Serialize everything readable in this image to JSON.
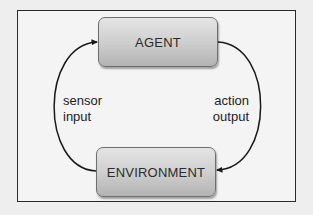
{
  "diagram": {
    "type": "feedback-loop",
    "nodes": {
      "agent": {
        "label": "AGENT"
      },
      "environment": {
        "label": "ENVIRONMENT"
      }
    },
    "edges": [
      {
        "from": "environment",
        "to": "agent",
        "side": "left",
        "label_lines": [
          "sensor",
          "input"
        ]
      },
      {
        "from": "agent",
        "to": "environment",
        "side": "right",
        "label_lines": [
          "action",
          "output"
        ]
      }
    ],
    "colors": {
      "background": "#eeeeee",
      "frame_border": "#2a2a2a",
      "node_fill_top": "#e4e4e4",
      "node_fill_bottom": "#b3b3b3",
      "arrow": "#1a1a1a",
      "text": "#2b2b2b"
    }
  }
}
